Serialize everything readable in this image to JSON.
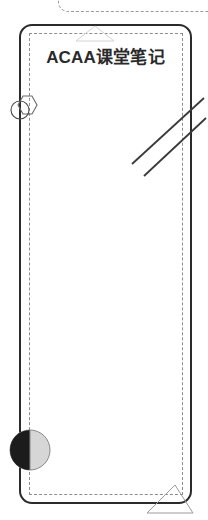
{
  "canvas": {
    "width": 208,
    "height": 520,
    "background_color": "#ffffff"
  },
  "card": {
    "title": "ACAA课堂笔记",
    "border_color": "#2b2b2b",
    "fill_color": "#ffffff",
    "guide_color": "#8d8d8d",
    "corner_radius": "13px"
  },
  "top_frame": {
    "style": "dashed",
    "color": "#9a9a9a"
  },
  "decorations": {
    "ghost_triangle": {
      "name": "ghost-triangle",
      "stroke_color": "#d4d4d4"
    },
    "hex_circle": {
      "name": "hexagon-circle-icon",
      "stroke_color": "#5a5a5a"
    },
    "diagonal_lines": {
      "name": "diagonal-lines",
      "stroke_color": "#3a3a3a",
      "count": 2
    },
    "half_circle": {
      "name": "half-filled-circle",
      "dark_half_color": "#1c1c1c",
      "light_half_color": "#d6d6d6",
      "stroke_color": "#8a8a8a"
    },
    "corner_triangle": {
      "name": "corner-triangle",
      "stroke_color": "#9b9b9b"
    }
  }
}
